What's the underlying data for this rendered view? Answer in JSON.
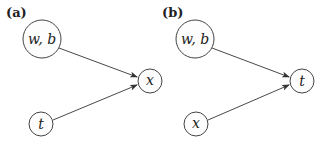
{
  "panels": [
    {
      "label": "(a)",
      "nodes": [
        {
          "id": "wb",
          "label": "w, b",
          "cx": 42,
          "cy": 39,
          "r": 19
        },
        {
          "id": "out",
          "label": "x",
          "cx": 150,
          "cy": 81,
          "r": 12
        },
        {
          "id": "in",
          "label": "t",
          "cx": 41,
          "cy": 124,
          "r": 12
        }
      ],
      "edges": [
        {
          "from": "wb",
          "to": "out"
        },
        {
          "from": "in",
          "to": "out"
        }
      ]
    },
    {
      "label": "(b)",
      "nodes": [
        {
          "id": "wb",
          "label": "w, b",
          "cx": 195,
          "cy": 39,
          "r": 19
        },
        {
          "id": "out",
          "label": "t",
          "cx": 302,
          "cy": 81,
          "r": 12
        },
        {
          "id": "in",
          "label": "x",
          "cx": 196,
          "cy": 124,
          "r": 12
        }
      ],
      "edges": [
        {
          "from": "wb",
          "to": "out"
        },
        {
          "from": "in",
          "to": "out"
        }
      ]
    }
  ]
}
